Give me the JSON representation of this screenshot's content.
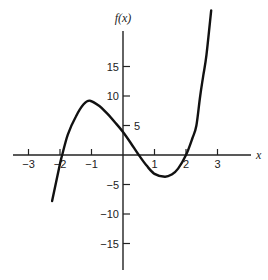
{
  "chart_data": {
    "type": "line",
    "title": "",
    "xlabel": "x",
    "ylabel": "f(x)",
    "xlim": [
      -3.5,
      4.0
    ],
    "ylim": [
      -19,
      21
    ],
    "grid": false,
    "legend": null,
    "x_ticks": [
      -3,
      -2,
      -1,
      1,
      2,
      3
    ],
    "x_tick_labels": [
      "−3",
      "−2",
      "−1",
      "1",
      "2",
      "3"
    ],
    "y_ticks": [
      15,
      10,
      5,
      -5,
      -10,
      -15
    ],
    "y_tick_labels": [
      "15",
      "10",
      "5",
      "−5",
      "−10",
      "−15"
    ],
    "series": [
      {
        "name": "f(x)",
        "x": [
          -2.25,
          -2.0,
          -1.93,
          -1.75,
          -1.5,
          -1.25,
          -1.05,
          -0.75,
          -0.5,
          -0.25,
          0.0,
          0.25,
          0.5,
          0.75,
          1.0,
          1.33,
          1.55,
          1.75,
          2.0,
          2.2,
          2.33,
          2.45,
          2.55,
          2.65,
          2.8
        ],
        "y": [
          -7.8,
          -1.5,
          0.0,
          3.5,
          6.5,
          8.6,
          9.2,
          8.3,
          7.0,
          5.5,
          3.9,
          2.0,
          0.0,
          -1.8,
          -3.2,
          -3.7,
          -3.3,
          -2.3,
          0.0,
          2.8,
          5.0,
          10.0,
          13.5,
          17.0,
          24.5
        ]
      }
    ],
    "annotations": {
      "local_max": [
        -1.05,
        9.2
      ],
      "local_min": [
        1.33,
        -3.7
      ],
      "y_intercept": 3.9,
      "roots": [
        -1.93,
        0.5,
        2.0
      ]
    }
  }
}
